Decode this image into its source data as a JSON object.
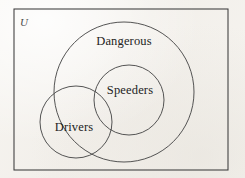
{
  "figure": {
    "type": "venn-diagram",
    "universe_label": "U",
    "background_color": "#f4f2ee",
    "stroke_color": "#4b4b4b",
    "frame_color": "#3b3b3b",
    "text_color": "#232323"
  },
  "frame": {
    "name": "universal-set-box",
    "x": 14,
    "y": 9,
    "width": 214,
    "height": 161
  },
  "sets": [
    {
      "id": "dangerous",
      "label": "Dangerous",
      "cx": 124,
      "cy": 92,
      "r": 70,
      "label_x": 124,
      "label_y": 45
    },
    {
      "id": "speeders",
      "label": "Speeders",
      "cx": 129,
      "cy": 100,
      "r": 35,
      "label_x": 130,
      "label_y": 94
    },
    {
      "id": "drivers",
      "label": "Drivers",
      "cx": 76,
      "cy": 122,
      "r": 36,
      "label_x": 74,
      "label_y": 131
    }
  ],
  "relations": {
    "speeders_in_dangerous": "subset",
    "drivers_overlaps_dangerous": "partial",
    "drivers_overlaps_speeders": "partial"
  },
  "chart_data": {
    "type": "venn",
    "title": "",
    "universe": "U",
    "sets": [
      "Dangerous",
      "Speeders",
      "Drivers"
    ],
    "relationships": [
      "Speeders is a proper subset of Dangerous",
      "Drivers partially overlaps Dangerous",
      "Drivers partially overlaps Speeders"
    ],
    "legend": "none",
    "grid": false
  }
}
